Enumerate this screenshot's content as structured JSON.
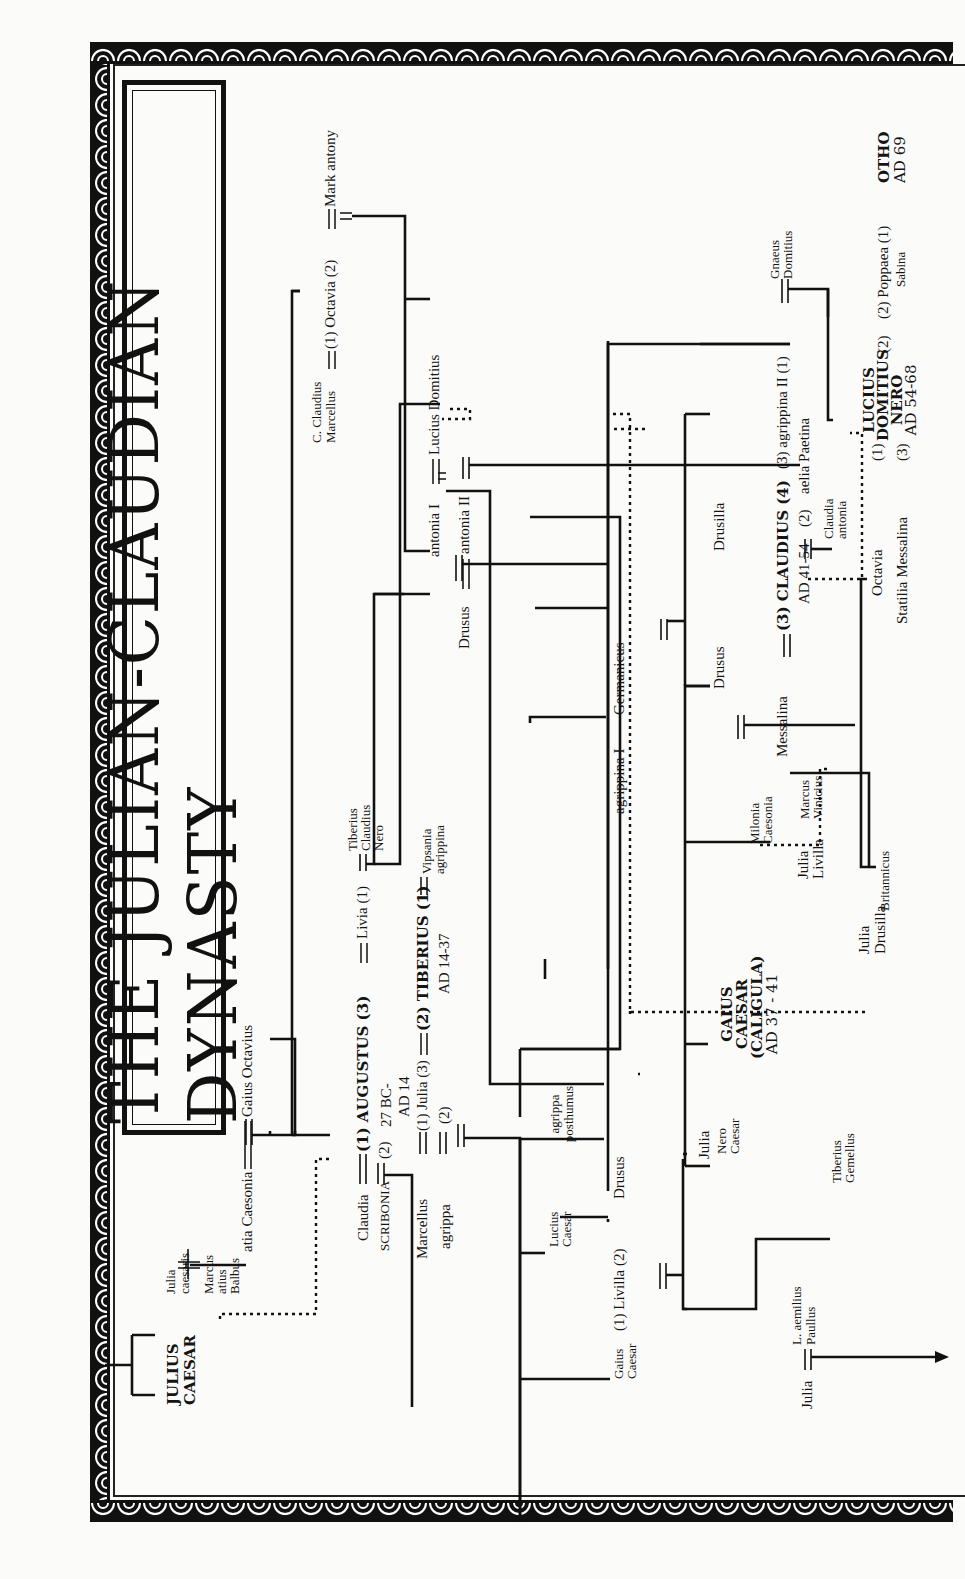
{
  "title": "THE JULIAN-CLAUDIAN DYNASTY",
  "orientation": "rotated 90 degrees counter-clockwise",
  "people": {
    "julius_caesar": "JULIUS CAESAR",
    "julia_caesaris": "Julia caesaris",
    "marcus_atius_balbus": "Marcus atius Balbus",
    "atia_caesonia": "atia Caesonia",
    "gaius_octavius": "Gaius Octavius",
    "claudia": "Claudia",
    "scribonia": "SCRIBONIA",
    "augustus": "(1) AUGUSTUS (3)",
    "augustus_2": "(2)",
    "augustus_reign_1": "27 BC-",
    "augustus_reign_2": "AD 14",
    "livia": "Livia (1)",
    "tiberius_claudius_nero": "Tiberius Claudius Nero",
    "c_claudius_marcellus": "C. Claudius Marcellus",
    "octavia": "(1) Octavia (2)",
    "mark_antony": "Mark antony",
    "antonia_i": "antonia I",
    "lucius_domitius": "Lucius Domitius",
    "marcellus": "Marcellus",
    "agrippa": "agrippa",
    "julia_augusti": "(1) Julia (3)",
    "julia_augusti_2": "(2)",
    "tiberius": "(2) TIBERIUS (1)",
    "tiberius_reign": "AD 14-37",
    "vipsania_agrippina": "Vipsania agrippina",
    "drusus_elder": "Drusus",
    "antonia_ii": "antonia II",
    "lucius_caesar": "Lucius Caesar",
    "gaius_caesar": "Gaius Caesar",
    "livilla": "(1) Livilla (2)",
    "drusus_younger": "Drusus",
    "agrippa_posthumus": "agrippa posthumus",
    "agrippina_i": "agrippina I",
    "germanicus": "Germanicus",
    "julia_aemilius": "Julia",
    "l_aemilius_paullus": "L. aemilius Paullus",
    "julia_drusi": "Julia",
    "nero_caesar": "Nero Caesar",
    "tiberius_gemellus": "Tiberius Gemellus",
    "caligula_1": "GAIUS",
    "caligula_2": "CAESAR",
    "caligula_3": "(CALIGULA)",
    "caligula_reign": "AD 37 - 41",
    "milonia_caesonia": "Milonia Caesonia",
    "julia_drusilla": "Julia Drusilla",
    "julia_livilla": "Julia Livilla",
    "marcus_vinicius": "Marcus Vinicius",
    "drusus_germanici": "Drusus",
    "messalina": "Messalina",
    "claudius": "(3) CLAUDIUS (4)",
    "claudius_reign": "AD 41-54",
    "claudius_2": "(2)",
    "drusilla": "Drusilla",
    "agrippina_ii": "(3) agrippina II (1)",
    "aelia_paetina": "aelia Paetina",
    "claudia_antonia": "Claudia antonia",
    "gnaeus_domitius": "Gnaeus Domitius",
    "britannicus": "Britannicus",
    "octavia_claudii": "Octavia",
    "octavia_marker": "(1)",
    "statilia_messalina": "Statilia Messalina",
    "statilia_marker": "(3)",
    "nero_1": "LUCIUS",
    "nero_2": "DOMITIUS",
    "nero_3": "NERO",
    "nero_reign": "AD 54-68",
    "nero_marker": "(2)",
    "poppaea": "(2) Poppaea (1)",
    "poppaea_2": "Sabina",
    "otho": "OTHO",
    "otho_reign": "AD 69"
  },
  "symbols": {
    "marriage": "double line =",
    "descent": "solid line",
    "adoption": "dotted line",
    "continues": "arrow"
  },
  "colors": {
    "ink": "#111111",
    "paper": "#fbfbfa"
  }
}
